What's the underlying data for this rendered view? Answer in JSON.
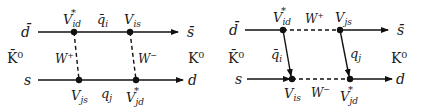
{
  "diagrams": [
    {
      "name": "box-diagram-1",
      "top_left_quark": "d̄",
      "top_right_quark": "s̄",
      "bottom_left_quark": "s",
      "bottom_right_quark": "d",
      "left_meson": "K̄⁰",
      "right_meson": "K⁰",
      "top_vertex_left": {
        "base": "V",
        "sub": "id",
        "sup": "*"
      },
      "top_vertex_right": {
        "base": "V",
        "sub": "is",
        "sup": ""
      },
      "bottom_vertex_left": {
        "base": "V",
        "sub": "js",
        "sup": ""
      },
      "bottom_vertex_right": {
        "base": "V",
        "sub": "jd",
        "sup": "*"
      },
      "top_propagator": {
        "base": "q̄",
        "sub": "i"
      },
      "bottom_propagator": {
        "base": "q",
        "sub": "j"
      },
      "left_boson": {
        "base": "W",
        "sup": "+"
      },
      "right_boson": {
        "base": "W",
        "sup": "−"
      }
    },
    {
      "name": "box-diagram-2",
      "top_left_quark": "d̄",
      "top_right_quark": "s̄",
      "bottom_left_quark": "s",
      "bottom_right_quark": "d",
      "left_meson": "K̄⁰",
      "right_meson": "K⁰",
      "top_vertex_left": {
        "base": "V",
        "sub": "id",
        "sup": "*"
      },
      "top_vertex_right": {
        "base": "V",
        "sub": "js",
        "sup": ""
      },
      "bottom_vertex_left": {
        "base": "V",
        "sub": "is",
        "sup": ""
      },
      "bottom_vertex_right": {
        "base": "V",
        "sub": "jd",
        "sup": "*"
      },
      "left_propagator": {
        "base": "q̄",
        "sub": "i"
      },
      "right_propagator": {
        "base": "q",
        "sub": "j"
      },
      "top_boson": {
        "base": "W",
        "sup": "+"
      },
      "bottom_boson": {
        "base": "W",
        "sup": "−"
      }
    }
  ]
}
